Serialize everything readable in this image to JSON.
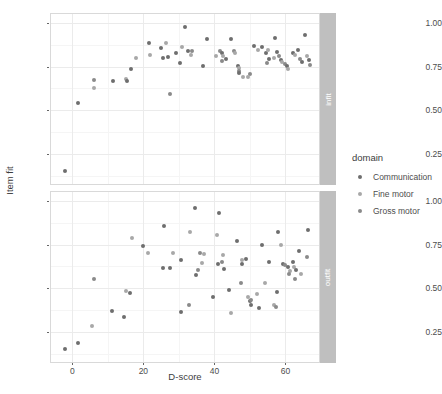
{
  "chart_data": {
    "type": "scatter",
    "title": "",
    "xlabel": "D-score",
    "ylabel": "Item fit",
    "xlim": [
      -6,
      70
    ],
    "ylim": [
      0.08,
      1.05
    ],
    "xticks": [
      0,
      20,
      40,
      60
    ],
    "yticks": [
      "0.25",
      "0.50",
      "0.75",
      "1.00"
    ],
    "ytick_values": [
      0.25,
      0.5,
      0.75,
      1.0
    ],
    "grid": true,
    "facet_variable": "fit statistic",
    "facets": [
      {
        "key": "infit",
        "label": "infit"
      },
      {
        "key": "outfit",
        "label": "outfit"
      }
    ],
    "legend": {
      "title": "domain",
      "position": "right",
      "entries": [
        {
          "label": "Communication",
          "color": "#6e6e6e"
        },
        {
          "label": "Fine motor",
          "color": "#a8a8a8"
        },
        {
          "label": "Gross motor",
          "color": "#8a8a8a"
        }
      ]
    },
    "panels": [
      {
        "facet": "infit",
        "points": [
          {
            "x": -2.0,
            "y": 0.155,
            "domain": "Communication"
          },
          {
            "x": 1.6,
            "y": 0.545,
            "domain": "Communication"
          },
          {
            "x": 6.0,
            "y": 0.672,
            "domain": "Gross motor"
          },
          {
            "x": 6.0,
            "y": 0.628,
            "domain": "Fine motor"
          },
          {
            "x": 11.5,
            "y": 0.668,
            "domain": "Communication"
          },
          {
            "x": 15.0,
            "y": 0.678,
            "domain": "Fine motor"
          },
          {
            "x": 15.3,
            "y": 0.668,
            "domain": "Communication"
          },
          {
            "x": 16.5,
            "y": 0.735,
            "domain": "Communication"
          },
          {
            "x": 18.0,
            "y": 0.8,
            "domain": "Fine motor"
          },
          {
            "x": 21.5,
            "y": 0.885,
            "domain": "Communication"
          },
          {
            "x": 21.8,
            "y": 0.815,
            "domain": "Fine motor"
          },
          {
            "x": 25.0,
            "y": 0.855,
            "domain": "Communication"
          },
          {
            "x": 25.4,
            "y": 0.798,
            "domain": "Communication"
          },
          {
            "x": 26.5,
            "y": 0.885,
            "domain": "Fine motor"
          },
          {
            "x": 26.8,
            "y": 0.805,
            "domain": "Communication"
          },
          {
            "x": 27.5,
            "y": 0.594,
            "domain": "Gross motor"
          },
          {
            "x": 29.2,
            "y": 0.828,
            "domain": "Communication"
          },
          {
            "x": 30.4,
            "y": 0.77,
            "domain": "Communication"
          },
          {
            "x": 31.0,
            "y": 0.862,
            "domain": "Fine motor"
          },
          {
            "x": 32.5,
            "y": 0.84,
            "domain": "Communication"
          },
          {
            "x": 33.3,
            "y": 0.818,
            "domain": "Fine motor"
          },
          {
            "x": 33.8,
            "y": 0.84,
            "domain": "Gross motor"
          },
          {
            "x": 31.8,
            "y": 0.975,
            "domain": "Communication"
          },
          {
            "x": 36.8,
            "y": 0.755,
            "domain": "Communication"
          },
          {
            "x": 38.0,
            "y": 0.908,
            "domain": "Communication"
          },
          {
            "x": 40.5,
            "y": 0.812,
            "domain": "Fine motor"
          },
          {
            "x": 41.6,
            "y": 0.84,
            "domain": "Gross motor"
          },
          {
            "x": 42.0,
            "y": 0.826,
            "domain": "Communication"
          },
          {
            "x": 42.4,
            "y": 0.808,
            "domain": "Fine motor"
          },
          {
            "x": 42.2,
            "y": 0.784,
            "domain": "Gross motor"
          },
          {
            "x": 43.2,
            "y": 0.794,
            "domain": "Communication"
          },
          {
            "x": 44.6,
            "y": 0.906,
            "domain": "Communication"
          },
          {
            "x": 45.5,
            "y": 0.838,
            "domain": "Gross motor"
          },
          {
            "x": 45.9,
            "y": 0.826,
            "domain": "Fine motor"
          },
          {
            "x": 46.6,
            "y": 0.752,
            "domain": "Communication"
          },
          {
            "x": 46.9,
            "y": 0.74,
            "domain": "Fine motor"
          },
          {
            "x": 47.0,
            "y": 0.726,
            "domain": "Gross motor"
          },
          {
            "x": 46.8,
            "y": 0.714,
            "domain": "Communication"
          },
          {
            "x": 48.0,
            "y": 0.692,
            "domain": "Fine motor"
          },
          {
            "x": 51.0,
            "y": 0.868,
            "domain": "Communication"
          },
          {
            "x": 52.4,
            "y": 0.842,
            "domain": "Fine motor"
          },
          {
            "x": 53.5,
            "y": 0.862,
            "domain": "Communication"
          },
          {
            "x": 54.5,
            "y": 0.83,
            "domain": "Communication"
          },
          {
            "x": 55.0,
            "y": 0.846,
            "domain": "Fine motor"
          },
          {
            "x": 55.5,
            "y": 0.792,
            "domain": "Communication"
          },
          {
            "x": 54.8,
            "y": 0.772,
            "domain": "Gross motor"
          },
          {
            "x": 56.8,
            "y": 0.8,
            "domain": "Fine motor"
          },
          {
            "x": 57.6,
            "y": 0.836,
            "domain": "Communication"
          },
          {
            "x": 58.2,
            "y": 0.808,
            "domain": "Gross motor"
          },
          {
            "x": 58.6,
            "y": 0.79,
            "domain": "Communication"
          },
          {
            "x": 59.0,
            "y": 0.778,
            "domain": "Fine motor"
          },
          {
            "x": 57.0,
            "y": 0.914,
            "domain": "Communication"
          },
          {
            "x": 60.0,
            "y": 0.762,
            "domain": "Gross motor"
          },
          {
            "x": 60.3,
            "y": 0.752,
            "domain": "Communication"
          },
          {
            "x": 60.6,
            "y": 0.738,
            "domain": "Fine motor"
          },
          {
            "x": 62.0,
            "y": 0.826,
            "domain": "Communication"
          },
          {
            "x": 62.6,
            "y": 0.818,
            "domain": "Fine motor"
          },
          {
            "x": 63.4,
            "y": 0.842,
            "domain": "Communication"
          },
          {
            "x": 64.0,
            "y": 0.796,
            "domain": "Gross motor"
          },
          {
            "x": 64.6,
            "y": 0.776,
            "domain": "Communication"
          },
          {
            "x": 65.4,
            "y": 0.93,
            "domain": "Communication"
          },
          {
            "x": 66.0,
            "y": 0.812,
            "domain": "Fine motor"
          },
          {
            "x": 66.6,
            "y": 0.788,
            "domain": "Communication"
          },
          {
            "x": 67.0,
            "y": 0.758,
            "domain": "Gross motor"
          },
          {
            "x": 50.0,
            "y": 0.708,
            "domain": "Gross motor"
          },
          {
            "x": 49.5,
            "y": 0.69,
            "domain": "Fine motor"
          }
        ]
      },
      {
        "facet": "outfit",
        "points": [
          {
            "x": -2.0,
            "y": 0.155,
            "domain": "Communication"
          },
          {
            "x": 1.6,
            "y": 0.19,
            "domain": "Communication"
          },
          {
            "x": 5.6,
            "y": 0.285,
            "domain": "Fine motor"
          },
          {
            "x": 6.0,
            "y": 0.556,
            "domain": "Gross motor"
          },
          {
            "x": 11.3,
            "y": 0.372,
            "domain": "Communication"
          },
          {
            "x": 14.5,
            "y": 0.334,
            "domain": "Communication"
          },
          {
            "x": 15.0,
            "y": 0.486,
            "domain": "Fine motor"
          },
          {
            "x": 16.2,
            "y": 0.474,
            "domain": "Communication"
          },
          {
            "x": 16.8,
            "y": 0.786,
            "domain": "Fine motor"
          },
          {
            "x": 20.0,
            "y": 0.742,
            "domain": "Communication"
          },
          {
            "x": 21.2,
            "y": 0.7,
            "domain": "Fine motor"
          },
          {
            "x": 25.8,
            "y": 0.858,
            "domain": "Communication"
          },
          {
            "x": 25.6,
            "y": 0.614,
            "domain": "Communication"
          },
          {
            "x": 27.5,
            "y": 0.614,
            "domain": "Communication"
          },
          {
            "x": 28.2,
            "y": 0.7,
            "domain": "Fine motor"
          },
          {
            "x": 30.6,
            "y": 0.366,
            "domain": "Communication"
          },
          {
            "x": 30.5,
            "y": 0.66,
            "domain": "Communication"
          },
          {
            "x": 32.8,
            "y": 0.404,
            "domain": "Gross motor"
          },
          {
            "x": 33.0,
            "y": 0.822,
            "domain": "Fine motor"
          },
          {
            "x": 34.6,
            "y": 0.96,
            "domain": "Communication"
          },
          {
            "x": 34.8,
            "y": 0.578,
            "domain": "Communication"
          },
          {
            "x": 35.4,
            "y": 0.606,
            "domain": "Gross motor"
          },
          {
            "x": 36.6,
            "y": 0.644,
            "domain": "Fine motor"
          },
          {
            "x": 37.2,
            "y": 0.698,
            "domain": "Fine motor"
          },
          {
            "x": 39.5,
            "y": 0.45,
            "domain": "Communication"
          },
          {
            "x": 41.2,
            "y": 0.928,
            "domain": "Communication"
          },
          {
            "x": 40.8,
            "y": 0.806,
            "domain": "Fine motor"
          },
          {
            "x": 41.0,
            "y": 0.64,
            "domain": "Communication"
          },
          {
            "x": 42.4,
            "y": 0.692,
            "domain": "Fine motor"
          },
          {
            "x": 42.2,
            "y": 0.652,
            "domain": "Gross motor"
          },
          {
            "x": 42.6,
            "y": 0.61,
            "domain": "Communication"
          },
          {
            "x": 44.0,
            "y": 0.492,
            "domain": "Communication"
          },
          {
            "x": 46.4,
            "y": 0.77,
            "domain": "Communication"
          },
          {
            "x": 47.8,
            "y": 0.664,
            "domain": "Fine motor"
          },
          {
            "x": 47.9,
            "y": 0.64,
            "domain": "Communication"
          },
          {
            "x": 47.6,
            "y": 0.528,
            "domain": "Gross motor"
          },
          {
            "x": 49.0,
            "y": 0.67,
            "domain": "Communication"
          },
          {
            "x": 49.4,
            "y": 0.452,
            "domain": "Fine motor"
          },
          {
            "x": 50.0,
            "y": 0.43,
            "domain": "Communication"
          },
          {
            "x": 50.2,
            "y": 0.436,
            "domain": "Gross motor"
          },
          {
            "x": 50.4,
            "y": 0.408,
            "domain": "Communication"
          },
          {
            "x": 52.0,
            "y": 0.47,
            "domain": "Fine motor"
          },
          {
            "x": 52.5,
            "y": 0.39,
            "domain": "Communication"
          },
          {
            "x": 53.5,
            "y": 0.746,
            "domain": "Communication"
          },
          {
            "x": 54.2,
            "y": 0.53,
            "domain": "Fine motor"
          },
          {
            "x": 55.4,
            "y": 0.65,
            "domain": "Communication"
          },
          {
            "x": 56.8,
            "y": 0.408,
            "domain": "Fine motor"
          },
          {
            "x": 57.6,
            "y": 0.482,
            "domain": "Communication"
          },
          {
            "x": 57.4,
            "y": 0.392,
            "domain": "Gross motor"
          },
          {
            "x": 58.0,
            "y": 0.822,
            "domain": "Communication"
          },
          {
            "x": 58.6,
            "y": 0.746,
            "domain": "Fine motor"
          },
          {
            "x": 59.4,
            "y": 0.64,
            "domain": "Communication"
          },
          {
            "x": 60.0,
            "y": 0.636,
            "domain": "Gross motor"
          },
          {
            "x": 60.6,
            "y": 0.62,
            "domain": "Communication"
          },
          {
            "x": 61.2,
            "y": 0.6,
            "domain": "Fine motor"
          },
          {
            "x": 61.0,
            "y": 0.58,
            "domain": "Gross motor"
          },
          {
            "x": 62.0,
            "y": 0.648,
            "domain": "Communication"
          },
          {
            "x": 62.4,
            "y": 0.622,
            "domain": "Fine motor"
          },
          {
            "x": 63.0,
            "y": 0.604,
            "domain": "Communication"
          },
          {
            "x": 62.8,
            "y": 0.552,
            "domain": "Gross motor"
          },
          {
            "x": 63.8,
            "y": 0.716,
            "domain": "Communication"
          },
          {
            "x": 64.4,
            "y": 0.58,
            "domain": "Fine motor"
          },
          {
            "x": 66.2,
            "y": 0.836,
            "domain": "Communication"
          },
          {
            "x": 66.0,
            "y": 0.68,
            "domain": "Gross motor"
          },
          {
            "x": 44.6,
            "y": 0.362,
            "domain": "Fine motor"
          },
          {
            "x": 35.8,
            "y": 0.7,
            "domain": "Gross motor"
          }
        ]
      }
    ]
  },
  "caption": ""
}
